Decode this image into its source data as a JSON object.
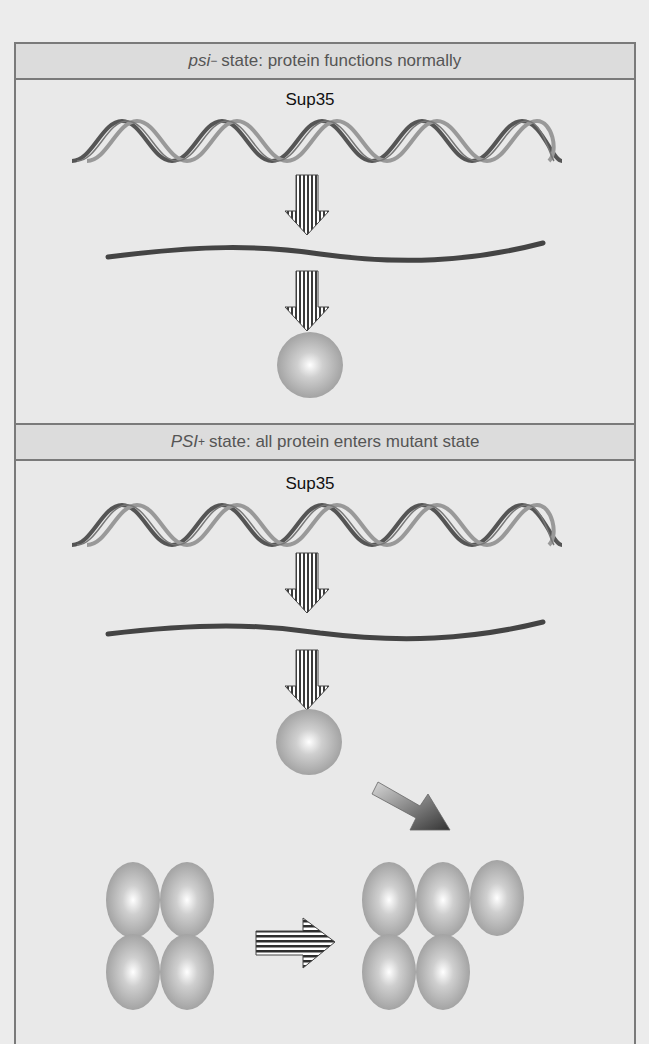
{
  "panels": [
    {
      "header": {
        "prefix_italic": "psi",
        "superscript": "−",
        "text": " state: protein functions normally"
      },
      "gene_label": "Sup35",
      "elements": [
        "dna-helix",
        "transcription-arrow",
        "mrna-strand",
        "translation-arrow",
        "protein-monomer"
      ]
    },
    {
      "header": {
        "prefix_italic": "PSI",
        "superscript": "+",
        "text": " state: all protein enters mutant state"
      },
      "gene_label": "Sup35",
      "elements": [
        "dna-helix",
        "transcription-arrow",
        "mrna-strand",
        "translation-arrow",
        "protein-monomer",
        "joining-arrow",
        "prion-aggregate-4",
        "growth-arrow",
        "prion-aggregate-5"
      ]
    }
  ],
  "colors": {
    "background": "#ececec",
    "header_fill": "#dcdcdc",
    "border": "#7a7a7a",
    "protein": "#a9a9a9",
    "mrna": "#4a4a4a"
  }
}
